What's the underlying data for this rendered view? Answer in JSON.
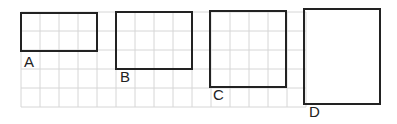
{
  "grid": {
    "x0": 21,
    "y0": 12,
    "cell": 19,
    "cols": 15,
    "rows": 5,
    "color": "#d6d6d6"
  },
  "rectangles": [
    {
      "label": "A",
      "x": 21,
      "y": 13,
      "w": 4,
      "h": 2,
      "label_x": 24,
      "label_y": 55
    },
    {
      "label": "B",
      "x": 116,
      "y": 12,
      "w": 4,
      "h": 3,
      "label_x": 120,
      "label_y": 70
    },
    {
      "label": "C",
      "x": 210,
      "y": 11,
      "w": 4,
      "h": 4,
      "label_x": 213,
      "label_y": 88
    },
    {
      "label": "D",
      "x": 304,
      "y": 9,
      "w": 4,
      "h": 5,
      "label_x": 309,
      "label_y": 105
    }
  ],
  "outline_color": "#222222"
}
